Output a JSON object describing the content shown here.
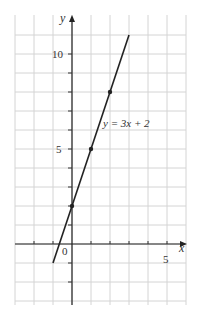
{
  "chart_data": {
    "type": "line",
    "title": "",
    "xlabel": "x",
    "ylabel": "y",
    "xlim": [
      -3,
      6
    ],
    "ylim": [
      -3,
      11
    ],
    "grid": true,
    "x_ticks_labeled": [
      {
        "value": 0,
        "label": "0"
      },
      {
        "value": 5,
        "label": "5"
      }
    ],
    "y_ticks_labeled": [
      {
        "value": 5,
        "label": "5"
      },
      {
        "value": 10,
        "label": "10"
      }
    ],
    "series": [
      {
        "name": "y = 3x + 2",
        "equation": "y = 3x + 2",
        "x_range": [
          -1,
          3
        ],
        "points": [
          [
            -1,
            -1
          ],
          [
            3,
            11
          ]
        ],
        "marked_points": [
          [
            0,
            2
          ],
          [
            1,
            5
          ],
          [
            2,
            8
          ]
        ]
      }
    ],
    "annotations": [
      {
        "text": "y = 3x + 2",
        "x": 1.6,
        "y": 6.2
      }
    ]
  },
  "labels": {
    "x_axis": "x",
    "y_axis": "y",
    "origin": "0",
    "x_five": "5",
    "y_five": "5",
    "y_ten": "10",
    "equation": "y = 3x + 2"
  }
}
